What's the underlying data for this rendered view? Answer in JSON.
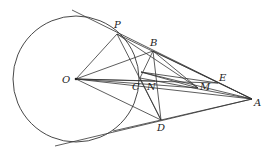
{
  "figure": {
    "type": "geometry-diagram",
    "circle": {
      "center": "O",
      "cx": 76,
      "cy": 79,
      "r": 63
    },
    "points": {
      "O": {
        "x": 76,
        "y": 79,
        "label": "O",
        "lx": 62,
        "ly": 83
      },
      "P": {
        "x": 117,
        "y": 34,
        "label": "P",
        "lx": 114,
        "ly": 28
      },
      "B": {
        "x": 153,
        "y": 51,
        "label": "B",
        "lx": 150,
        "ly": 46
      },
      "F": {
        "x": 141,
        "y": 72,
        "label": "",
        "lx": 0,
        "ly": 0
      },
      "C": {
        "x": 140,
        "y": 78,
        "label": "C",
        "lx": 132,
        "ly": 90
      },
      "N": {
        "x": 155,
        "y": 81,
        "label": "N",
        "lx": 147,
        "ly": 90
      },
      "M": {
        "x": 198,
        "y": 88,
        "label": "M",
        "lx": 200,
        "ly": 90
      },
      "E": {
        "x": 218,
        "y": 83,
        "label": "E",
        "lx": 219,
        "ly": 81
      },
      "A": {
        "x": 252,
        "y": 99,
        "label": "A",
        "lx": 254,
        "ly": 106
      },
      "D": {
        "x": 161,
        "y": 120,
        "label": "D",
        "lx": 157,
        "ly": 131
      }
    },
    "segments": [
      [
        "T1",
        "A"
      ],
      [
        "T2",
        "A"
      ],
      [
        "O",
        "P"
      ],
      [
        "O",
        "B"
      ],
      [
        "O",
        "D"
      ],
      [
        "O",
        "A"
      ],
      [
        "O",
        "E"
      ],
      [
        "O",
        "M"
      ],
      [
        "O",
        "N"
      ],
      [
        "P",
        "A"
      ],
      [
        "P",
        "M"
      ],
      [
        "P",
        "D"
      ],
      [
        "B",
        "A"
      ],
      [
        "B",
        "D"
      ],
      [
        "B",
        "M"
      ],
      [
        "B",
        "C"
      ],
      [
        "C",
        "D"
      ],
      [
        "C",
        "A"
      ],
      [
        "F",
        "A"
      ],
      [
        "F",
        "M"
      ],
      [
        "F",
        "E"
      ],
      [
        "D",
        "A"
      ],
      [
        "D",
        "Q"
      ]
    ],
    "extra_points": {
      "T1": {
        "x": 72,
        "y": 10
      },
      "T2": {
        "x": 55,
        "y": 146
      },
      "Q": {
        "x": 113,
        "y": 131
      }
    }
  }
}
